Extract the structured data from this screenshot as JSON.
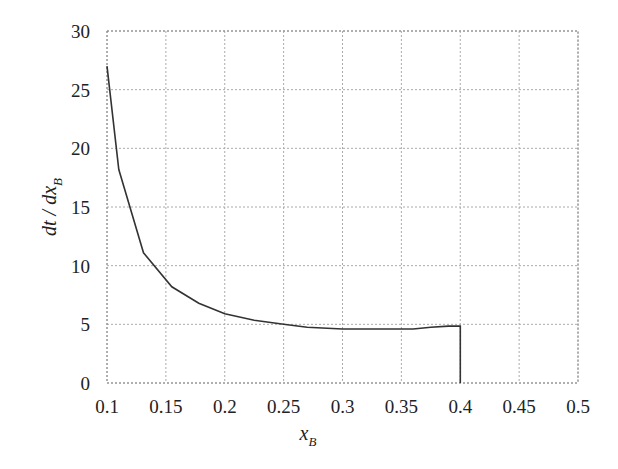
{
  "chart_data": {
    "type": "line",
    "title": "",
    "xlabel": "x_B",
    "ylabel": "dt / dx_B",
    "xlim": [
      0.1,
      0.5
    ],
    "ylim": [
      0,
      30
    ],
    "grid": true,
    "x_ticks": [
      "0.1",
      "0.15",
      "0.2",
      "0.25",
      "0.3",
      "0.35",
      "0.4",
      "0.45",
      "0.5"
    ],
    "y_ticks": [
      "0",
      "5",
      "10",
      "15",
      "20",
      "25",
      "30"
    ],
    "series": [
      {
        "name": "dt/dx_B",
        "color": "#333333",
        "x": [
          0.1,
          0.11,
          0.131,
          0.155,
          0.178,
          0.2,
          0.225,
          0.25,
          0.27,
          0.3,
          0.33,
          0.36,
          0.375,
          0.39,
          0.4,
          0.4
        ],
        "y": [
          27.0,
          18.2,
          11.1,
          8.2,
          6.8,
          5.9,
          5.35,
          5.0,
          4.75,
          4.6,
          4.6,
          4.6,
          4.75,
          4.85,
          4.85,
          0.0
        ]
      }
    ]
  }
}
